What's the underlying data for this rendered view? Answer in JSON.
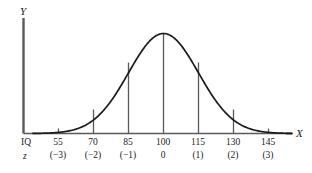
{
  "figure": {
    "type": "normal-distribution-curve",
    "axes": {
      "y_label": "Y",
      "x_label": "X"
    },
    "row_labels": {
      "iq": "IQ",
      "z": "z"
    }
  },
  "chart_data": {
    "type": "line",
    "title": "",
    "subtitle": "",
    "xlabel": "X",
    "ylabel": "Y",
    "grid": false,
    "legend": null,
    "annotations": [
      "IQ",
      "z"
    ],
    "distribution": {
      "name": "normal",
      "mean": 100,
      "sd": 15
    },
    "categories": [
      "55",
      "70",
      "85",
      "100",
      "115",
      "130",
      "145"
    ],
    "iq_ticks": [
      "55",
      "70",
      "85",
      "100",
      "115",
      "130",
      "145"
    ],
    "z_ticks": [
      "(−3)",
      "(−2)",
      "(−1)",
      "0",
      "(1)",
      "(2)",
      "(3)"
    ],
    "z_values": [
      -3,
      -2,
      -1,
      0,
      1,
      2,
      3
    ],
    "x": [
      55,
      70,
      85,
      100,
      115,
      130,
      145
    ],
    "values": [
      0.011,
      0.135,
      0.607,
      1.0,
      0.607,
      0.135,
      0.011
    ],
    "ylim": [
      0,
      1.08
    ],
    "xlim": [
      40,
      160
    ],
    "ordinate_lines_at_iq": [
      70,
      85,
      100,
      115,
      130
    ],
    "colors": {
      "curve": "#1a1a1a",
      "axis": "#4d4d4d",
      "ordinate": "#4d4d4d",
      "background": "#ffffff"
    }
  }
}
